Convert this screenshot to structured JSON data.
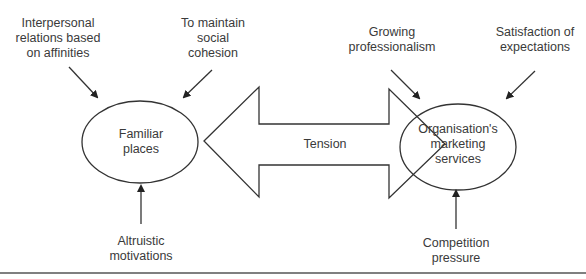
{
  "diagram": {
    "nodes": {
      "familiar_places": {
        "lines": [
          "Familiar",
          "places"
        ]
      },
      "org_marketing": {
        "lines": [
          "Organisation's",
          "marketing",
          "services"
        ]
      }
    },
    "relation": {
      "label": "Tension",
      "type": "bidirectional"
    },
    "influences": {
      "interpersonal": {
        "lines": [
          "Interpersonal",
          "relations based",
          "on affinities"
        ],
        "target": "familiar_places"
      },
      "social_cohesion": {
        "lines": [
          "To maintain",
          "social",
          "cohesion"
        ],
        "target": "familiar_places"
      },
      "altruistic": {
        "lines": [
          "Altruistic",
          "motivations"
        ],
        "target": "familiar_places"
      },
      "professionalism": {
        "lines": [
          "Growing",
          "professionalism"
        ],
        "target": "org_marketing"
      },
      "satisfaction": {
        "lines": [
          "Satisfaction of",
          "expectations"
        ],
        "target": "org_marketing"
      },
      "competition": {
        "lines": [
          "Competition",
          "pressure"
        ],
        "target": "org_marketing"
      }
    },
    "colors": {
      "stroke": "#333333",
      "text": "#3a3a3a",
      "background": "#ffffff"
    }
  }
}
